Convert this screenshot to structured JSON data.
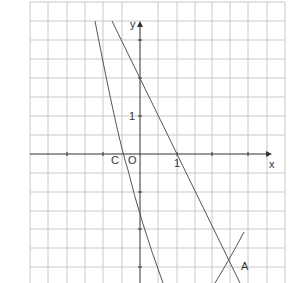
{
  "figure": {
    "type": "coordinate-graph",
    "grid": {
      "cell_px": 18.5,
      "cells_per_unit": 2,
      "x_range": [
        -3,
        4
      ],
      "y_range": [
        -3.5,
        4
      ]
    },
    "axes": {
      "x_label": "x",
      "y_label": "y",
      "origin_label": "O",
      "x_tick_label": "1",
      "y_tick_label": "1"
    },
    "points": [
      {
        "label": "C",
        "x": -0.4,
        "y": 0
      },
      {
        "label": "A",
        "x": 2.5,
        "y": -3
      }
    ],
    "lines": [
      {
        "name": "line",
        "equation": "y = -2x + 2"
      }
    ],
    "curves": [
      {
        "name": "steep-curve",
        "passes_through": [
          [
            -0.4,
            0
          ],
          [
            0,
            -2
          ]
        ]
      },
      {
        "name": "curve-through-A",
        "passes_through": [
          [
            2.5,
            -3
          ]
        ]
      }
    ],
    "colors": {
      "grid": "#c8c8c8",
      "axis": "#333333",
      "curve": "#555555"
    }
  }
}
